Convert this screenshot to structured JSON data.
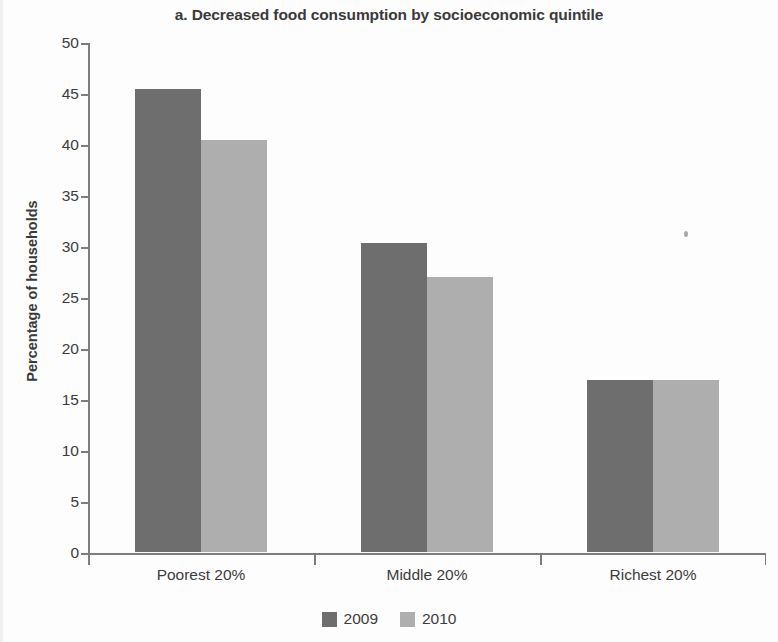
{
  "chart_data": {
    "type": "bar",
    "title": "a. Decreased food consumption by socioeconomic quintile",
    "xlabel": "",
    "ylabel": "Percentage of households",
    "categories": [
      "Poorest 20%",
      "Middle 20%",
      "Richest 20%"
    ],
    "series": [
      {
        "name": "2009",
        "color": "#6e6e6e",
        "values": [
          45.3,
          30.2,
          16.8
        ]
      },
      {
        "name": "2010",
        "color": "#aeaeae",
        "values": [
          40.3,
          26.9,
          16.8
        ]
      }
    ],
    "ylim": [
      0,
      50
    ],
    "ytick_step": 5,
    "yticks": [
      0,
      5,
      10,
      15,
      20,
      25,
      30,
      35,
      40,
      45,
      50
    ],
    "ytick_labels": [
      "0",
      "5",
      "10",
      "15",
      "20",
      "25",
      "30",
      "35",
      "40",
      "45",
      "50"
    ],
    "grid": false,
    "legend_position": "bottom-center",
    "legend": [
      "2009",
      "2010"
    ]
  },
  "figure": {
    "title": "a. Decreased food consumption by socioeconomic quintile",
    "y_axis_title": "Percentage of households"
  }
}
